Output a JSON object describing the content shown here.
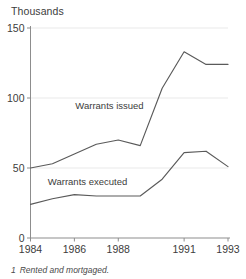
{
  "chart_data": {
    "type": "line",
    "title": "",
    "unit_title": "Thousands",
    "xlabel": "",
    "ylabel": "Thousands",
    "x": [
      1984,
      1985,
      1986,
      1987,
      1988,
      1989,
      1990,
      1991,
      1992,
      1993
    ],
    "xtick_labels": [
      "1984",
      "1986",
      "1988",
      "1991",
      "1993"
    ],
    "xtick_values": [
      1984,
      1986,
      1988,
      1991,
      1993
    ],
    "xlim": [
      1984,
      1993
    ],
    "ytick_labels": [
      "0",
      "50",
      "100",
      "150"
    ],
    "ytick_values": [
      0,
      50,
      100,
      150
    ],
    "ylim": [
      0,
      150
    ],
    "grid": "horizontal-faint",
    "legend_position": "inline-annotations",
    "series": [
      {
        "name": "Warrants issued",
        "label": "Warrants issued",
        "values": [
          50,
          53,
          60,
          67,
          70,
          66,
          107,
          133,
          124,
          124
        ]
      },
      {
        "name": "Warrants executed",
        "label": "Warrants executed",
        "values": [
          24,
          28,
          31,
          30,
          30,
          30,
          42,
          61,
          62,
          51
        ]
      }
    ],
    "annotations": [
      {
        "text": "Warrants issued",
        "x": 1987.6,
        "y": 92
      },
      {
        "text": "Warrants executed",
        "x": 1986.6,
        "y": 38
      }
    ],
    "footnote": {
      "marker": "1",
      "text": "Rented and mortgaged."
    },
    "colors": {
      "line": "#5a5a5a",
      "axis": "#8d8d8d",
      "grid": "#e9e9e9",
      "text": "#3c3c3c",
      "background": "#ffffff"
    }
  }
}
